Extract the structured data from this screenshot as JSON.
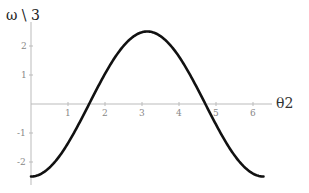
{
  "chart_data": {
    "type": "line",
    "title": "",
    "xlabel": "θ2",
    "ylabel": "ω \\ 3",
    "x_ticks": [
      1,
      2,
      3,
      4,
      5,
      6
    ],
    "y_ticks": [
      -2,
      -1,
      1,
      2
    ],
    "xlim": [
      0,
      6.2832
    ],
    "ylim": [
      -2.5,
      2.5
    ],
    "grid": false,
    "legend": null,
    "series": [
      {
        "name": "ω\\3",
        "function": "-2.5*cos(θ2)",
        "color": "#111111",
        "x": [
          0,
          0.5,
          1,
          1.5,
          1.5708,
          2,
          2.5,
          3,
          3.1416,
          3.5,
          4,
          4.5,
          4.7124,
          5,
          5.5,
          6,
          6.2832
        ],
        "y": [
          -2.5,
          -2.19,
          -1.35,
          -0.18,
          0,
          1.04,
          2.0,
          2.47,
          2.5,
          2.34,
          1.63,
          0.53,
          0,
          -0.71,
          -1.77,
          -2.4,
          -2.5
        ]
      }
    ]
  }
}
